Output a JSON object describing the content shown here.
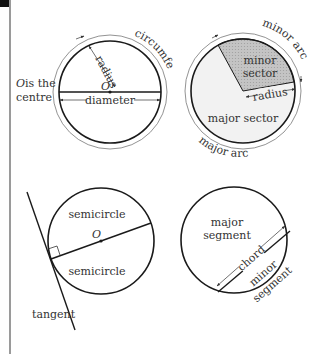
{
  "diagram": {
    "colors": {
      "stroke": "#1a1a1a",
      "thin_stroke": "#555555",
      "minor_sector_fill": "#bdbdbd",
      "major_sector_fill": "#f2f2f2",
      "text": "#333333",
      "edge_line": "#9a9a9a"
    },
    "panel1": {
      "labels": {
        "circumference": "circumference",
        "radius": "radius",
        "diameter": "diameter",
        "centre_point": "O",
        "centre_note_line1": "O is the",
        "centre_note_line2": "centre"
      }
    },
    "panel2": {
      "labels": {
        "minor_arc": "minor arc",
        "major_arc": "major arc",
        "minor_sector_line1": "minor",
        "minor_sector_line2": "sector",
        "major_sector": "major sector",
        "radius": "radius"
      }
    },
    "panel3": {
      "labels": {
        "semicircle_top": "semicircle",
        "semicircle_bottom": "semicircle",
        "centre_point": "O",
        "tangent": "tangent"
      }
    },
    "panel4": {
      "labels": {
        "major_segment_line1": "major",
        "major_segment_line2": "segment",
        "chord": "chord",
        "minor_segment_line1": "minor",
        "minor_segment_line2": "segment"
      }
    }
  }
}
